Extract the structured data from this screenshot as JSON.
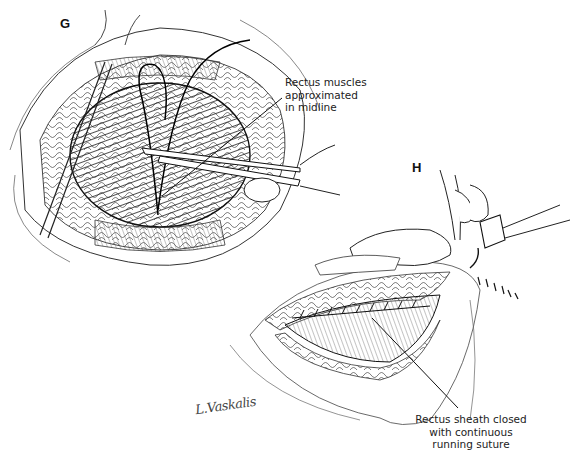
{
  "figure": {
    "panels": [
      {
        "id": "G",
        "label": "G"
      },
      {
        "id": "H",
        "label": "H"
      }
    ],
    "callouts": {
      "g": {
        "lines": [
          "Rectus muscles",
          "approximated",
          "in midline"
        ]
      },
      "h": {
        "lines": [
          "Rectus sheath closed",
          "with continuous",
          "running suture"
        ]
      }
    },
    "signature": "L.Vaskalis",
    "colors": {
      "ink": "#111111",
      "background": "#ffffff",
      "hatch": "#555555"
    }
  }
}
